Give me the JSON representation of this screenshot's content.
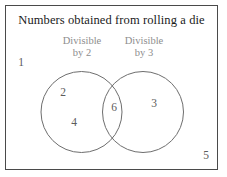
{
  "diagram": {
    "title": "Numbers obtained from rolling a die",
    "type": "venn-diagram",
    "sets": [
      {
        "id": "divisible-by-2",
        "caption_line1": "Divisible",
        "caption_line2": "by 2",
        "members": [
          "2",
          "4"
        ]
      },
      {
        "id": "divisible-by-3",
        "caption_line1": "Divisible",
        "caption_line2": "by 3",
        "members": [
          "3"
        ]
      }
    ],
    "intersection": {
      "members": [
        "6"
      ]
    },
    "outside": {
      "members": [
        "1",
        "5"
      ]
    },
    "elements": {
      "one": "1",
      "two": "2",
      "three": "3",
      "four": "4",
      "five": "5",
      "six": "6"
    },
    "colors": {
      "border": "#4a4a4a",
      "circle_stroke": "#6e6e6e",
      "title_text": "#1a1a1a",
      "caption_text": "#8d8d8d",
      "element_text": "#5c5c5c",
      "background": "#ffffff"
    }
  }
}
